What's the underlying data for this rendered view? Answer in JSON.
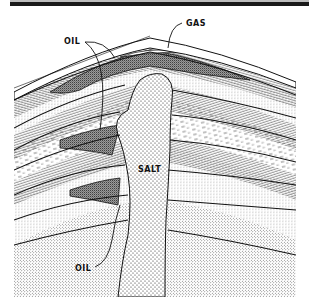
{
  "diagram": {
    "type": "geologic-cross-section",
    "labels": {
      "gas": "GAS",
      "oil_top": "OIL",
      "salt": "SALT",
      "oil_bottom": "OIL"
    },
    "colors": {
      "ink": "#111111",
      "paper": "#ffffff",
      "header_rule": "#1a1a1a"
    }
  }
}
